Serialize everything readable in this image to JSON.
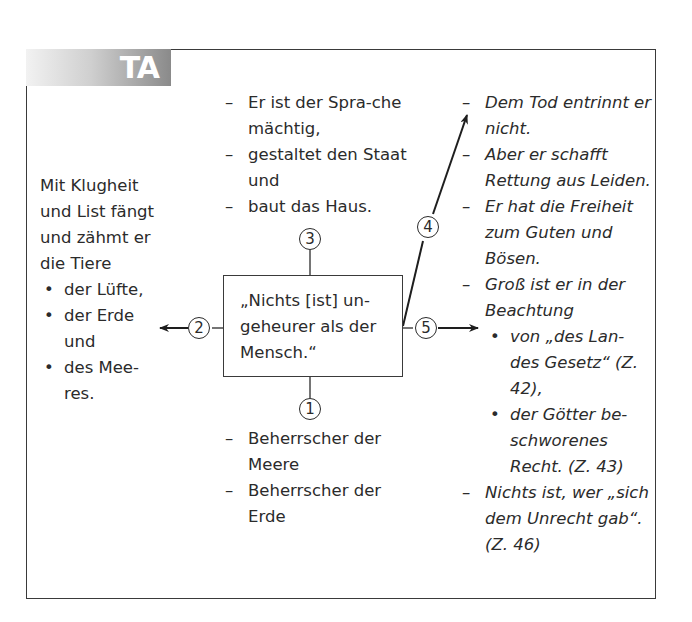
{
  "tab": {
    "label": "TA"
  },
  "center": {
    "quote": "„Nichts [ist] un-geheurer als der Mensch.“"
  },
  "markers": {
    "m1": "1",
    "m2": "2",
    "m3": "3",
    "m4": "4",
    "m5": "5"
  },
  "top_list": [
    "Er ist der Spra-che mächtig,",
    "gestaltet den Staat und",
    "baut das Haus."
  ],
  "bottom_list": [
    "Beherrscher der Meere",
    "Beherrscher der Erde"
  ],
  "left": {
    "intro": "Mit Klugheit und List fängt und zähmt er die Tiere",
    "items": [
      "der Lüfte,",
      "der Erde und",
      "des Mee-res."
    ]
  },
  "right_list": {
    "items": [
      "Dem Tod entrinnt er nicht.",
      "Aber er schafft Rettung aus Leiden.",
      "Er hat die Freiheit zum Guten und Bösen."
    ],
    "item4_intro": "Groß ist er in der Beachtung",
    "item4_sub": [
      "von „des Lan-des Gesetz“ (Z. 42),",
      "der Götter be-schworenes Recht. (Z. 43)"
    ],
    "item5": "Nichts ist, wer „sich dem Unrecht gab“. (Z. 46)"
  },
  "colors": {
    "ink": "#2b2b2b",
    "frame": "#3a3a3a",
    "tab_dark": "#8a8a8a"
  }
}
